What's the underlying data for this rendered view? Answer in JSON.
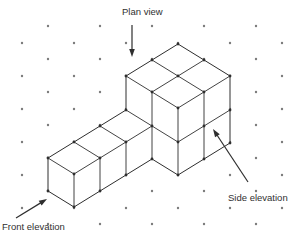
{
  "figure": {
    "background": "#ffffff",
    "line_color": "#2e2e2e",
    "grid_dot_color": "#7b7b7b",
    "vertex_dot_color": "#2e2e2e",
    "dot_grid": {
      "x_start": 22,
      "x_step": 26,
      "columns": 11,
      "even_col_ys": [
        43,
        76,
        109,
        142,
        175,
        208
      ],
      "odd_col_ys": [
        26,
        59,
        92,
        125,
        158,
        191,
        224
      ]
    },
    "solid": {
      "description": "11 unit cubes: ground row of 3 cubes plus a 2x2x2 block",
      "outline": [
        [
          48,
          158
        ],
        [
          74,
          142
        ],
        [
          100,
          126
        ],
        [
          126,
          110
        ],
        [
          126,
          76
        ],
        [
          178,
          44
        ],
        [
          230,
          76
        ],
        [
          230,
          143
        ],
        [
          178,
          175
        ],
        [
          152,
          159
        ],
        [
          126,
          175
        ],
        [
          100,
          191
        ],
        [
          74,
          207
        ],
        [
          48,
          191
        ]
      ],
      "internal_edges": [
        [
          [
            74,
            142
          ],
          [
            100,
            158
          ]
        ],
        [
          [
            100,
            158
          ],
          [
            74,
            174
          ]
        ],
        [
          [
            74,
            174
          ],
          [
            48,
            158
          ]
        ],
        [
          [
            74,
            174
          ],
          [
            74,
            207
          ]
        ],
        [
          [
            100,
            158
          ],
          [
            100,
            191
          ]
        ],
        [
          [
            100,
            126
          ],
          [
            126,
            142
          ]
        ],
        [
          [
            126,
            142
          ],
          [
            100,
            158
          ]
        ],
        [
          [
            126,
            142
          ],
          [
            126,
            175
          ]
        ],
        [
          [
            152,
            126
          ],
          [
            126,
            142
          ]
        ],
        [
          [
            152,
            92
          ],
          [
            152,
            159
          ]
        ],
        [
          [
            126,
            110
          ],
          [
            178,
            142
          ]
        ],
        [
          [
            126,
            76
          ],
          [
            178,
            108
          ]
        ],
        [
          [
            178,
            108
          ],
          [
            230,
            76
          ]
        ],
        [
          [
            152,
            60
          ],
          [
            204,
            92
          ]
        ],
        [
          [
            152,
            92
          ],
          [
            204,
            60
          ]
        ],
        [
          [
            178,
            108
          ],
          [
            178,
            175
          ]
        ],
        [
          [
            204,
            92
          ],
          [
            204,
            159
          ]
        ],
        [
          [
            178,
            142
          ],
          [
            230,
            110
          ]
        ]
      ],
      "extra_vertex_dots": [
        [
          178,
          76
        ],
        [
          204,
          126
        ]
      ]
    },
    "labels": {
      "plan": {
        "text": "Plan view",
        "arrow": {
          "tail": [
            132,
            25
          ],
          "tip": [
            132,
            57
          ]
        }
      },
      "front": {
        "text": "Front elevation",
        "arrow": {
          "tail": [
            16,
            218
          ],
          "tip": [
            47,
            199
          ]
        }
      },
      "side": {
        "text": "Side elevation",
        "arrow": {
          "tail": [
            248,
            182
          ],
          "tip": [
            213,
            129
          ]
        }
      }
    }
  }
}
